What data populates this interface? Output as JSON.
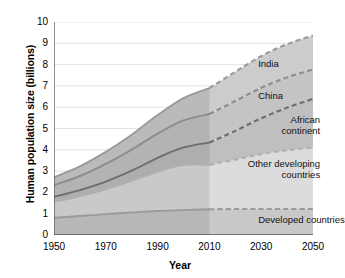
{
  "chart_data": {
    "type": "area",
    "title": "",
    "subtitle": "",
    "xlabel": "Year",
    "ylabel": "Human population size (billions)",
    "xlim": [
      1950,
      2050
    ],
    "ylim": [
      0,
      10
    ],
    "xticks": [
      1950,
      1970,
      1990,
      2010,
      2030,
      2050
    ],
    "yticks": [
      0,
      1,
      2,
      3,
      4,
      5,
      6,
      7,
      8,
      9,
      10
    ],
    "grid": true,
    "legend": "in-plot annotations",
    "stacked": true,
    "projection_start": 2010,
    "annotations": [
      {
        "label": "India",
        "x": 2035,
        "y": 8.05
      },
      {
        "label": "China",
        "x": 2035,
        "y": 6.55
      },
      {
        "label": "African\ncontinent",
        "x": 2035,
        "y": 5.15
      },
      {
        "label": "Other developing\ncountries",
        "x": 2035,
        "y": 3.1
      },
      {
        "label": "Developed countries",
        "x": 2035,
        "y": 0.72
      }
    ],
    "x": [
      1950,
      1960,
      1970,
      1980,
      1990,
      2000,
      2010,
      2020,
      2030,
      2040,
      2050
    ],
    "series": [
      {
        "name": "Developed countries",
        "color": "#c9c9c9",
        "values": [
          0.81,
          0.89,
          0.98,
          1.06,
          1.13,
          1.17,
          1.21,
          1.22,
          1.22,
          1.22,
          1.22
        ]
      },
      {
        "name": "Other developing countries",
        "color": "#dcdcdc",
        "values": [
          0.75,
          0.93,
          1.16,
          1.48,
          1.85,
          2.12,
          2.08,
          2.32,
          2.58,
          2.76,
          2.88
        ]
      },
      {
        "name": "African continent",
        "color": "#bfbfbf",
        "values": [
          0.23,
          0.29,
          0.37,
          0.48,
          0.64,
          0.82,
          1.05,
          1.35,
          1.68,
          2.0,
          2.29
        ]
      },
      {
        "name": "China",
        "color": "#c4c4c4",
        "values": [
          0.55,
          0.66,
          0.83,
          0.99,
          1.14,
          1.27,
          1.34,
          1.4,
          1.43,
          1.42,
          1.38
        ]
      },
      {
        "name": "India",
        "color": "#cccccc",
        "values": [
          0.37,
          0.45,
          0.56,
          0.7,
          0.87,
          1.05,
          1.22,
          1.37,
          1.49,
          1.56,
          1.6
        ]
      }
    ],
    "cumulative_totals": [
      2.71,
      3.22,
      3.9,
      4.71,
      5.63,
      6.43,
      6.9,
      7.66,
      8.4,
      8.96,
      9.37
    ],
    "boundary_curves": [
      {
        "name": "top-of-developed",
        "values": [
          0.81,
          0.89,
          0.98,
          1.06,
          1.13,
          1.17,
          1.21,
          1.22,
          1.22,
          1.22,
          1.22
        ],
        "style": "solid-then-dashed",
        "color": "#9a9a9a"
      },
      {
        "name": "top-of-other-developing",
        "values": [
          1.56,
          1.82,
          2.14,
          2.54,
          2.98,
          3.29,
          3.29,
          3.54,
          3.8,
          3.98,
          4.1
        ],
        "style": "solid-then-dashed",
        "color": "#b0b0b0"
      },
      {
        "name": "top-of-african-continent",
        "values": [
          1.79,
          2.11,
          2.51,
          3.02,
          3.62,
          4.11,
          4.34,
          4.89,
          5.48,
          5.98,
          6.39
        ],
        "style": "solid-then-dashed",
        "color": "#6e6e6e"
      },
      {
        "name": "top-of-china",
        "values": [
          2.34,
          2.77,
          3.34,
          4.01,
          4.76,
          5.38,
          5.68,
          6.29,
          6.91,
          7.4,
          7.77
        ],
        "style": "solid-then-dashed",
        "color": "#8c8c8c"
      },
      {
        "name": "top-of-india",
        "values": [
          2.71,
          3.22,
          3.9,
          4.71,
          5.63,
          6.43,
          6.9,
          7.66,
          8.4,
          8.96,
          9.37
        ],
        "style": "solid-then-dashed",
        "color": "#9a9a9a"
      }
    ],
    "colors": {
      "grid": "#e2e2e2",
      "axis": "#555555",
      "historic_overlay": "#000000",
      "text": "#000000"
    }
  }
}
